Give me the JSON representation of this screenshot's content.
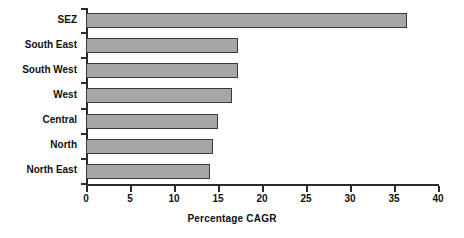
{
  "chart_data": {
    "type": "bar",
    "orientation": "horizontal",
    "title": "",
    "xlabel": "Percentage CAGR",
    "ylabel": "",
    "xlim": [
      0,
      40
    ],
    "xticks": [
      0,
      5,
      10,
      15,
      20,
      25,
      30,
      35,
      40
    ],
    "xtick_labels": [
      "0",
      "5",
      "10",
      "15",
      "20",
      "25",
      "30",
      "35",
      "40"
    ],
    "grid": false,
    "legend": null,
    "categories": [
      "SEZ",
      "South East",
      "South West",
      "West",
      "Central",
      "North",
      "North East"
    ],
    "values": [
      36.5,
      17.3,
      17.3,
      16.6,
      15.0,
      14.4,
      14.1
    ],
    "series": [
      {
        "name": "Percentage CAGR",
        "values": [
          36.5,
          17.3,
          17.3,
          16.6,
          15.0,
          14.4,
          14.1
        ]
      }
    ],
    "bar_fill_color": "#a6a6a6",
    "bar_border_color": "#3a3a3a",
    "axis_color": "#2b2b2b",
    "background_color": "#ffffff"
  }
}
